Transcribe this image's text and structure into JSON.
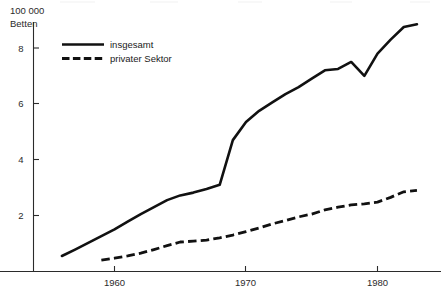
{
  "chart_data": {
    "type": "line",
    "title": "",
    "subtitle": "",
    "xlabel": "",
    "ylabel": "100 000 Betten",
    "unit_line1": "100 000",
    "unit_line2": "Betten",
    "xlim": [
      1955,
      1984
    ],
    "ylim": [
      0,
      9.4
    ],
    "grid": false,
    "legend_position": "top-left",
    "y_ticks": [
      2,
      4,
      6,
      8
    ],
    "y_tick_labels": [
      "2",
      "4",
      "6",
      "8"
    ],
    "x_ticks": [
      1960,
      1970,
      1980
    ],
    "x_tick_labels": [
      "1960",
      "1970",
      "1980"
    ],
    "series": [
      {
        "name": "insgesamt",
        "style": "solid",
        "color": "#111111",
        "x": [
          1956,
          1957,
          1958,
          1959,
          1960,
          1961,
          1962,
          1963,
          1964,
          1965,
          1966,
          1967,
          1968,
          1969,
          1970,
          1971,
          1972,
          1973,
          1974,
          1975,
          1976,
          1977,
          1978,
          1979,
          1980,
          1981,
          1982,
          1983
        ],
        "values": [
          0.55,
          0.78,
          1.02,
          1.26,
          1.5,
          1.78,
          2.05,
          2.3,
          2.55,
          2.72,
          2.82,
          2.95,
          3.1,
          4.7,
          5.35,
          5.75,
          6.05,
          6.35,
          6.6,
          6.9,
          7.2,
          7.25,
          7.5,
          7.0,
          7.8,
          8.3,
          8.75,
          8.85
        ]
      },
      {
        "name": "privater Sektor",
        "style": "dashed",
        "color": "#111111",
        "x": [
          1959,
          1960,
          1961,
          1962,
          1963,
          1964,
          1965,
          1966,
          1967,
          1968,
          1969,
          1970,
          1971,
          1972,
          1973,
          1974,
          1975,
          1976,
          1977,
          1978,
          1979,
          1980,
          1981,
          1982,
          1983
        ],
        "values": [
          0.4,
          0.47,
          0.55,
          0.65,
          0.78,
          0.92,
          1.05,
          1.08,
          1.12,
          1.2,
          1.3,
          1.42,
          1.55,
          1.7,
          1.82,
          1.95,
          2.05,
          2.2,
          2.3,
          2.38,
          2.42,
          2.48,
          2.65,
          2.85,
          2.9
        ]
      }
    ]
  },
  "legend": {
    "entries": [
      {
        "label": "insgesamt",
        "style": "solid"
      },
      {
        "label": "privater Sektor",
        "style": "dashed"
      }
    ]
  }
}
